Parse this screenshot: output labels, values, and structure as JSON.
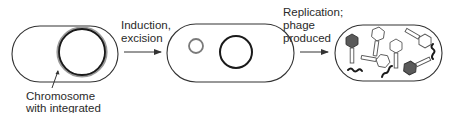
{
  "diagram": {
    "type": "process-flow",
    "stages": [
      {
        "id": "lysogen",
        "label_lines": [
          "Chromosome",
          "with integrated"
        ],
        "contents": [
          "bacterial chromosome with integrated prophage (double ring)"
        ]
      },
      {
        "id": "excised",
        "contents": [
          "excised phage DNA (small circle)",
          "bacterial chromosome (large circle)"
        ]
      },
      {
        "id": "lytic",
        "contents": [
          "assembled phage particles",
          "filled phage heads",
          "phage DNA fragments"
        ]
      }
    ],
    "arrows": [
      {
        "from": "lysogen",
        "to": "excised",
        "label_lines": [
          "Induction,",
          "excision"
        ]
      },
      {
        "from": "excised",
        "to": "lytic",
        "label_lines": [
          "Replication;",
          "phage",
          "produced"
        ]
      }
    ],
    "colors": {
      "outline": "#333333",
      "chromosome": "#1a1a1a",
      "phage_dna": "#7a7a7a",
      "filled_head": "#555555",
      "text": "#2a2a2a"
    }
  }
}
